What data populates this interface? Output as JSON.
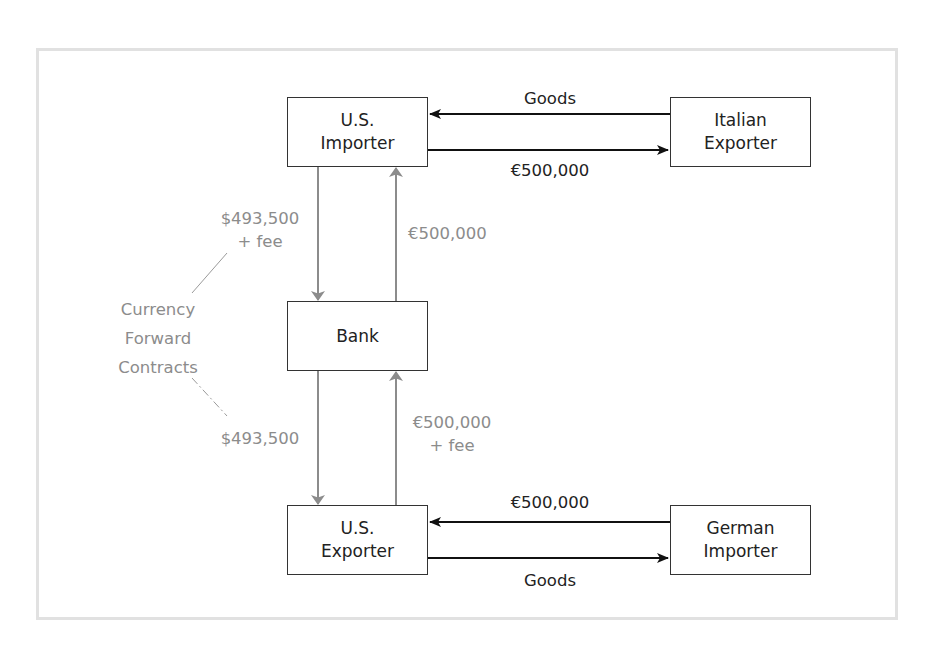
{
  "diagram": {
    "nodes": {
      "us_importer": [
        "U.S.",
        "Importer"
      ],
      "italian_exporter": [
        "Italian",
        "Exporter"
      ],
      "bank": [
        "Bank"
      ],
      "us_exporter": [
        "U.S.",
        "Exporter"
      ],
      "german_importer": [
        "German",
        "Importer"
      ]
    },
    "edges": {
      "italian_to_us_importer": "Goods",
      "us_importer_to_italian": "€500,000",
      "us_importer_to_bank": [
        "$493,500",
        "+ fee"
      ],
      "bank_to_us_importer": "€500,000",
      "bank_to_us_exporter": "$493,500",
      "us_exporter_to_bank": [
        "€500,000",
        "+ fee"
      ],
      "german_to_us_exporter": "€500,000",
      "us_exporter_to_german": "Goods"
    },
    "annotation": [
      "Currency",
      "Forward",
      "Contracts"
    ],
    "colors": {
      "trade_flow": "#111111",
      "bank_flow": "#8c8c8c",
      "frame": "#e1e1e1"
    }
  }
}
